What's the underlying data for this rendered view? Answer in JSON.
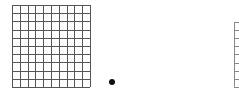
{
  "grids": [
    {
      "name": "grid-10x10",
      "x": 12,
      "y": 5,
      "cols": 10,
      "rows": 10,
      "cell_w": 7.8,
      "cell_h": 8.2,
      "stroke": "#555555"
    },
    {
      "name": "grid-partial",
      "x": 234,
      "y": 22,
      "cols": 1,
      "rows": 8,
      "cell_w": 8,
      "cell_h": 8.1,
      "stroke": "#888888"
    }
  ],
  "dot": {
    "x": 112,
    "y": 82,
    "r": 3,
    "color": "#111111"
  }
}
